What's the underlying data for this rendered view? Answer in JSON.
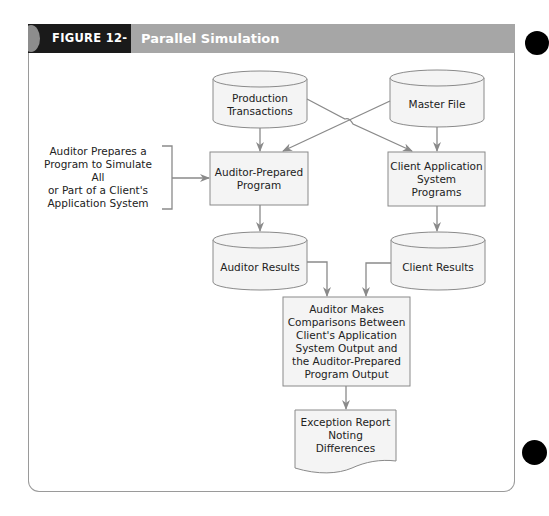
{
  "figure": {
    "number": "FIGURE 12-10",
    "title": "Parallel Simulation"
  },
  "colors": {
    "header_bar": "#a6a6a6",
    "label_block": "#1a1a1a",
    "shape_fill": "#f4f4f4",
    "stroke": "#8a8a8a",
    "text": "#222222"
  },
  "nodes": {
    "production_transactions": {
      "type": "cylinder",
      "label": "Production\nTransactions"
    },
    "master_file": {
      "type": "cylinder",
      "label": "Master File"
    },
    "auditor_prepared_program": {
      "type": "process",
      "label": "Auditor-Prepared\nProgram"
    },
    "client_application_programs": {
      "type": "process",
      "label": "Client Application\nSystem\nPrograms"
    },
    "auditor_results": {
      "type": "cylinder",
      "label": "Auditor Results"
    },
    "client_results": {
      "type": "cylinder",
      "label": "Client Results"
    },
    "comparison": {
      "type": "process",
      "label": "Auditor Makes\nComparisons Between\nClient's Application\nSystem Output and\nthe Auditor-Prepared\nProgram Output"
    },
    "exception_report": {
      "type": "document",
      "label": "Exception Report\nNoting\nDifferences"
    }
  },
  "annotation": {
    "label": "Auditor Prepares a\nProgram to Simulate All\nor Part of a Client's\nApplication System",
    "target": "auditor_prepared_program"
  },
  "edges": [
    {
      "from": "production_transactions",
      "to": "auditor_prepared_program"
    },
    {
      "from": "production_transactions",
      "to": "client_application_programs"
    },
    {
      "from": "master_file",
      "to": "auditor_prepared_program"
    },
    {
      "from": "master_file",
      "to": "client_application_programs"
    },
    {
      "from": "auditor_prepared_program",
      "to": "auditor_results"
    },
    {
      "from": "client_application_programs",
      "to": "client_results"
    },
    {
      "from": "auditor_results",
      "to": "comparison"
    },
    {
      "from": "client_results",
      "to": "comparison"
    },
    {
      "from": "comparison",
      "to": "exception_report"
    }
  ]
}
